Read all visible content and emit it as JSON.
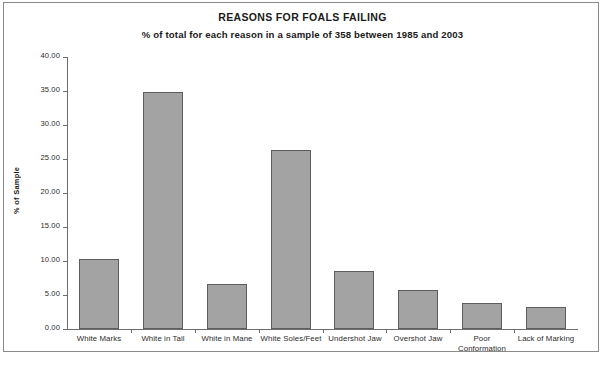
{
  "chart_data": {
    "type": "bar",
    "title": "REASONS FOR FOALS FAILING",
    "subtitle": "% of total for each reason in a sample of 358 between 1985 and 2003",
    "xlabel": "",
    "ylabel": "% of Sample",
    "categories": [
      "White Marks",
      "White in Tail",
      "White in Mane",
      "White Soles/Feet",
      "Undershot Jaw",
      "Overshot Jaw",
      "Poor Conformation",
      "Lack of Marking"
    ],
    "values": [
      10.3,
      34.9,
      6.6,
      26.3,
      8.6,
      5.7,
      3.8,
      3.2
    ],
    "ylim": [
      0,
      40
    ],
    "ytick_step": 5,
    "ytick_labels": [
      "0.00",
      "5.00",
      "10.00",
      "15.00",
      "20.00",
      "25.00",
      "30.00",
      "35.00",
      "40.00"
    ],
    "grid": false,
    "legend": "none",
    "bar_fill_color": "#a3a3a3",
    "bar_border_color": "#5d5d5d",
    "axis_color": "#6e6e6e",
    "text_color": "#1a1a1a",
    "background_color": "#ffffff"
  },
  "caption": {
    "bottom_text": ""
  }
}
